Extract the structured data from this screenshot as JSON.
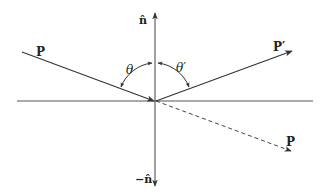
{
  "diagram": {
    "colors": {
      "line": "#444444",
      "text": "#222222",
      "background": "#ffffff"
    },
    "origin": {
      "x": 155,
      "y": 101
    },
    "labels": {
      "incident": "P",
      "normal_up": "n̂",
      "normal_down": "−n̂",
      "theta": "θ",
      "theta_prime": "θ′",
      "reflected": "P′",
      "transmitted": "P"
    },
    "elements": {
      "surface_line": {
        "x1": 17,
        "y1": 101,
        "x2": 313,
        "y2": 101
      },
      "normal_axis": {
        "x1": 155,
        "y1": 14,
        "x2": 155,
        "y2": 185
      },
      "incident_ray": {
        "x1": 22,
        "y1": 52,
        "x2": 155,
        "y2": 101
      },
      "reflected_ray": {
        "x1": 155,
        "y1": 101,
        "x2": 290,
        "y2": 52
      },
      "transmitted_ray_dashed": {
        "x1": 155,
        "y1": 101,
        "x2": 290,
        "y2": 150
      }
    }
  }
}
